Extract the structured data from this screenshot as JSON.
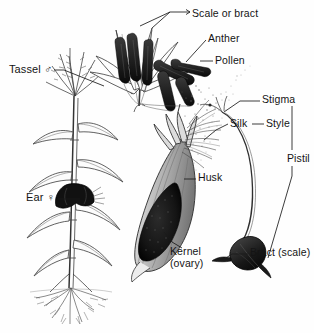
{
  "figure": {
    "style": "black-and-white botanical line drawing",
    "background_color": "#fefefe",
    "ink_color": "#141414",
    "width": 314,
    "height": 333
  },
  "labels": [
    {
      "id": "scale-or-bract",
      "text": "Scale or bract",
      "x": 192,
      "y": 8
    },
    {
      "id": "anther",
      "text": "Anther",
      "x": 208,
      "y": 33
    },
    {
      "id": "pollen",
      "text": "Pollen",
      "x": 215,
      "y": 58
    },
    {
      "id": "tassel",
      "text": "Tassel ♂",
      "x": 9,
      "y": 68
    },
    {
      "id": "stigma",
      "text": "Stigma",
      "x": 262,
      "y": 98
    },
    {
      "id": "silk",
      "text": "Silk",
      "x": 230,
      "y": 121
    },
    {
      "id": "style",
      "text": "Style",
      "x": 266,
      "y": 121
    },
    {
      "id": "pistil",
      "text": "Pistil",
      "x": 287,
      "y": 157
    },
    {
      "id": "husk",
      "text": "Husk",
      "x": 198,
      "y": 175
    },
    {
      "id": "ear",
      "text": "Ear ♀",
      "x": 26,
      "y": 196
    },
    {
      "id": "kernel",
      "text": "Kernel\n(ovary)",
      "x": 170,
      "y": 250
    },
    {
      "id": "bract-scale",
      "text": "Bract (scale)",
      "x": 250,
      "y": 251
    }
  ],
  "structures": {
    "whole_plant": "Corn plant with stalk, alternating leaves, tassel at apex, ear at mid-stalk, fibrous prop roots at base",
    "tassel_spikelet": "Enlarged male spikelet with open glumes and pendant dark anthers shedding pollen",
    "pollen_cloud": "Stippled pollen grains drifting from anthers toward the silk",
    "ear_section": "Cut-away ear showing husk, rows of dark kernels, and silk tuft emerging at tip",
    "pistil_detail": "Single pistil: stigma and silk at top, long style, swollen dark bract (scale) at base"
  }
}
